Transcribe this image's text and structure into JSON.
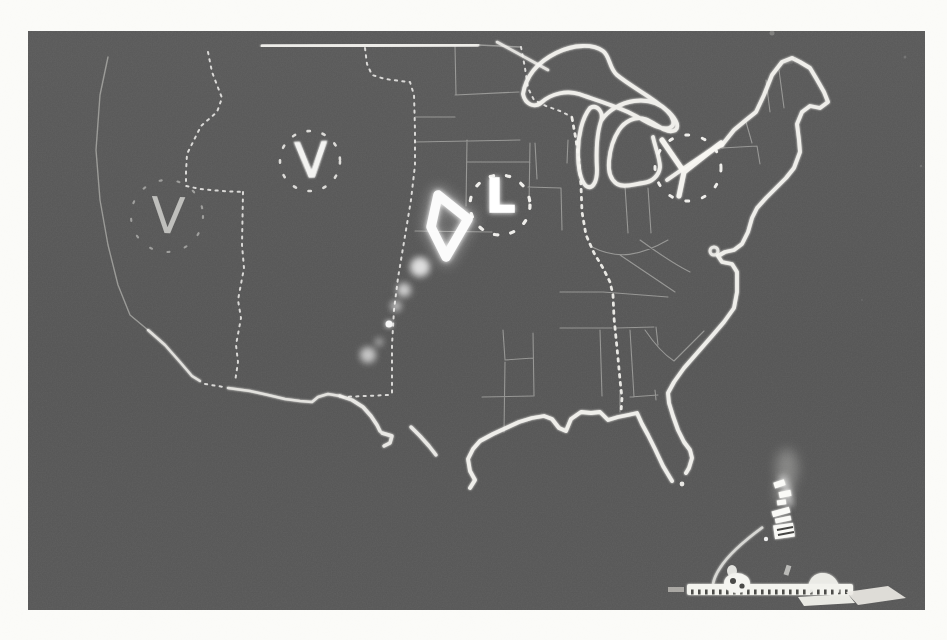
{
  "scene": {
    "description": "black-and-white photograph of a computer-drawn United States map on a dark display",
    "page_background": "#fbfbf8",
    "photo_gray": "#565656",
    "map_line_white": "#f5f4f0"
  },
  "map": {
    "region": "continental United States",
    "markers": [
      {
        "id": "marker-west",
        "symbol": "V",
        "ring": "dotted-circle"
      },
      {
        "id": "marker-plains",
        "symbol": "V",
        "ring": "dotted-circle"
      },
      {
        "id": "marker-midwest",
        "symbol": "L",
        "ring": "dotted-circle"
      },
      {
        "id": "marker-northeast",
        "symbol": "",
        "ring": "dotted-circle-with-three-prong-fork"
      }
    ],
    "storm_echo": "bright triangular echo with fading trail toward southwest"
  },
  "console_reflection": {
    "elements": [
      "smoke-streak",
      "lit-switch-cluster",
      "cable-arc",
      "lit-keyboard-row",
      "hand-highlights"
    ]
  }
}
